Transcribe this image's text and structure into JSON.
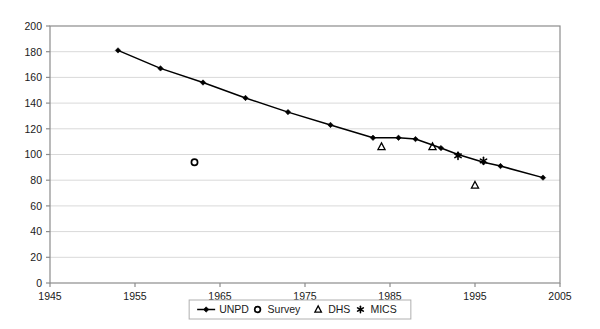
{
  "chart_data": {
    "type": "line",
    "title": "",
    "subtitle": "",
    "xlabel": "",
    "ylabel": "",
    "xlim": [
      1945,
      2005
    ],
    "ylim": [
      0,
      200
    ],
    "xticks": [
      1945,
      1955,
      1965,
      1975,
      1985,
      1995,
      2005
    ],
    "ytick_labels": [
      "0",
      "20",
      "40",
      "60",
      "80",
      "100",
      "120",
      "140",
      "160",
      "180",
      "200"
    ],
    "yticks": [
      0,
      20,
      40,
      60,
      80,
      100,
      120,
      140,
      160,
      180,
      200
    ],
    "xtick_labels": [
      "1945",
      "1955",
      "1965",
      "1975",
      "1985",
      "1995",
      "2005"
    ],
    "grid": "horizontal",
    "grid_color": "#d9d9d9",
    "legend_position": "bottom",
    "axis_color": "#808080",
    "series": [
      {
        "name": "UNPD",
        "marker": "diamond",
        "style": "line-with-markers",
        "color": "#000000",
        "points": [
          {
            "x": 1953,
            "y": 181
          },
          {
            "x": 1958,
            "y": 167
          },
          {
            "x": 1963,
            "y": 156
          },
          {
            "x": 1968,
            "y": 144
          },
          {
            "x": 1973,
            "y": 133
          },
          {
            "x": 1978,
            "y": 123
          },
          {
            "x": 1983,
            "y": 113
          },
          {
            "x": 1986,
            "y": 113
          },
          {
            "x": 1988,
            "y": 112
          },
          {
            "x": 1991,
            "y": 105
          },
          {
            "x": 1993,
            "y": 100
          },
          {
            "x": 1996,
            "y": 94
          },
          {
            "x": 1998,
            "y": 91
          },
          {
            "x": 2003,
            "y": 82
          }
        ]
      },
      {
        "name": "Survey",
        "marker": "circle-open",
        "style": "markers-only",
        "color": "#000000",
        "points": [
          {
            "x": 1962,
            "y": 94
          }
        ]
      },
      {
        "name": "DHS",
        "marker": "triangle-open",
        "style": "markers-only",
        "color": "#000000",
        "points": [
          {
            "x": 1984,
            "y": 106
          },
          {
            "x": 1990,
            "y": 106
          },
          {
            "x": 1995,
            "y": 76
          }
        ]
      },
      {
        "name": "MICS",
        "marker": "asterisk",
        "style": "markers-only",
        "color": "#000000",
        "points": [
          {
            "x": 1993,
            "y": 99
          },
          {
            "x": 1996,
            "y": 95
          }
        ]
      }
    ]
  },
  "legend": {
    "items": [
      {
        "label": "UNPD",
        "marker": "diamond-line"
      },
      {
        "label": "Survey",
        "marker": "circle-open"
      },
      {
        "label": "DHS",
        "marker": "triangle-open"
      },
      {
        "label": "MICS",
        "marker": "asterisk"
      }
    ]
  }
}
